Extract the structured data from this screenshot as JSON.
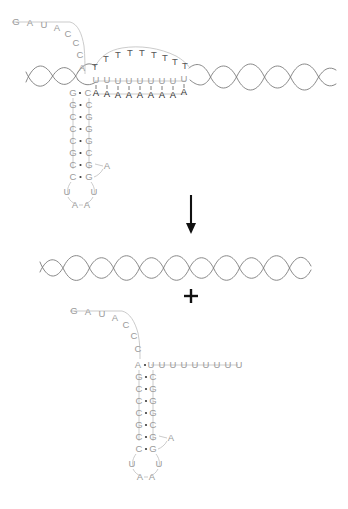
{
  "diagram": {
    "colors": {
      "rna_letter": "#9a9a9a",
      "dna_letter": "#555555",
      "paired_letter": "#2b2b2b",
      "helix_stroke": "#7a7a7a",
      "connector": "#b9b9b9",
      "arrow": "#111111",
      "background": "#ffffff"
    },
    "symbols": {
      "reaction_arrow": "down-arrow",
      "plus": "+"
    }
  },
  "top_complex": {
    "name": "rna-dna-hybrid-r-loop",
    "rna_tail_curve": [
      "G",
      "A",
      "U",
      "A",
      "C",
      "C",
      "C"
    ],
    "rna_tail_junction": "A",
    "displaced_dna_strand": [
      "T",
      "T",
      "T",
      "T",
      "T",
      "T",
      "T",
      "T",
      "T"
    ],
    "rna_horizontal_arm": [
      "U",
      "U",
      "U",
      "U",
      "U",
      "U",
      "U",
      "U",
      "U"
    ],
    "dna_template_strand": [
      "A",
      "A",
      "A",
      "A",
      "A",
      "A",
      "A",
      "A",
      "A"
    ],
    "junction_left": "G",
    "junction_right": "C",
    "stem_left": [
      "G",
      "C",
      "C",
      "C",
      "G",
      "C",
      "C"
    ],
    "stem_right": [
      "C",
      "G",
      "G",
      "G",
      "C",
      "G",
      "G"
    ],
    "loop_right_bulge": "A",
    "loop_left_u": "U",
    "loop_right_u": "U",
    "loop_bottom": [
      "A",
      "A"
    ]
  },
  "middle": {
    "name": "reannealed-dna-duplex",
    "label_arrow": "reaction proceeds downward",
    "plus_sign": "+"
  },
  "bottom_rna": {
    "name": "released-rna-hairpin",
    "rna_tail_curve": [
      "G",
      "A",
      "U",
      "A",
      "C",
      "C",
      "C"
    ],
    "junction_left": "A",
    "horizontal_arm": [
      "U",
      "U",
      "U",
      "U",
      "U",
      "U",
      "U",
      "U",
      "U"
    ],
    "stem_left": [
      "G",
      "C",
      "C",
      "C",
      "G",
      "C",
      "C"
    ],
    "stem_right": [
      "C",
      "G",
      "G",
      "G",
      "C",
      "G",
      "G"
    ],
    "loop_right_bulge": "A",
    "loop_left_u": "U",
    "loop_right_u": "U",
    "loop_bottom": [
      "A",
      "A"
    ]
  }
}
